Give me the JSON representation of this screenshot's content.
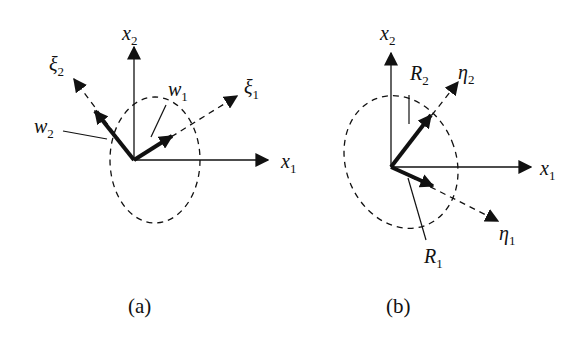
{
  "panels": [
    {
      "caption": "(a)",
      "axes": {
        "x": "x",
        "x_sub": "1",
        "y": "x",
        "y_sub": "2"
      },
      "principal_axes": [
        {
          "sym": "ξ",
          "sub": "1"
        },
        {
          "sym": "ξ",
          "sub": "2"
        }
      ],
      "vectors": [
        {
          "sym": "w",
          "sub": "1"
        },
        {
          "sym": "w",
          "sub": "2"
        }
      ]
    },
    {
      "caption": "(b)",
      "axes": {
        "x": "x",
        "x_sub": "1",
        "y": "x",
        "y_sub": "2"
      },
      "principal_axes": [
        {
          "sym": "η",
          "sub": "1"
        },
        {
          "sym": "η",
          "sub": "2"
        }
      ],
      "vectors": [
        {
          "sym": "R",
          "sub": "1"
        },
        {
          "sym": "R",
          "sub": "2"
        }
      ]
    }
  ]
}
